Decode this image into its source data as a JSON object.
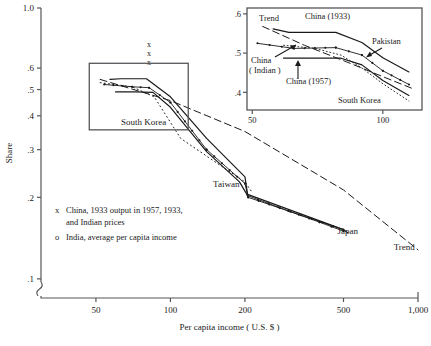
{
  "chart_data": {
    "type": "line",
    "title": "",
    "xlabel": "Per capita income ( U.S. $ )",
    "ylabel": "Share",
    "xscale": "log",
    "yscale": "log",
    "xlim": [
      30,
      1000
    ],
    "ylim": [
      0.085,
      1.0
    ],
    "xticks": [
      "50",
      "100",
      "200",
      "500",
      "1,000"
    ],
    "xtick_values": [
      50,
      100,
      200,
      500,
      1000
    ],
    "yticks": [
      "1.0",
      ".6",
      ".5",
      ".4",
      ".3",
      ".2",
      ".1"
    ],
    "ytick_values": [
      1.0,
      0.6,
      0.5,
      0.4,
      0.3,
      0.2,
      0.1
    ],
    "axis_break": true,
    "grid": false,
    "legend": [
      {
        "marker": "x",
        "text_line1": "China, 1933 output in 1957, 1933,",
        "text_line2": "and Indian prices"
      },
      {
        "marker": "o",
        "text_line1": "India, average per capita income",
        "text_line2": ""
      }
    ],
    "annotations": [
      {
        "name": "south-korea",
        "label": "South Korea",
        "x": 78,
        "y": 0.37
      },
      {
        "name": "taiwan",
        "label": "Taiwan",
        "x": 168,
        "y": 0.218
      },
      {
        "name": "japan",
        "label": "Japan",
        "x": 520,
        "y": 0.147
      },
      {
        "name": "trend",
        "label": "Trend",
        "x": 880,
        "y": 0.128
      }
    ],
    "point_markers_x": [
      {
        "x": 82,
        "y": 0.72
      },
      {
        "x": 82,
        "y": 0.665
      },
      {
        "x": 82,
        "y": 0.618
      }
    ],
    "series": [
      {
        "name": "China (1933)",
        "style": "solid",
        "points": [
          [
            57,
            0.545
          ],
          [
            63,
            0.548
          ],
          [
            80,
            0.548
          ],
          [
            100,
            0.47
          ],
          [
            140,
            0.33
          ],
          [
            200,
            0.238
          ],
          [
            205,
            0.205
          ],
          [
            500,
            0.152
          ],
          [
            520,
            0.148
          ]
        ]
      },
      {
        "name": "China (Indian)",
        "style": "solid-dots",
        "points": [
          [
            54,
            0.522
          ],
          [
            70,
            0.512
          ],
          [
            82,
            0.508
          ],
          [
            100,
            0.448
          ],
          [
            140,
            0.3
          ],
          [
            200,
            0.225
          ],
          [
            206,
            0.2
          ],
          [
            500,
            0.152
          ]
        ]
      },
      {
        "name": "China (1957)",
        "style": "solid",
        "points": [
          [
            60,
            0.49
          ],
          [
            72,
            0.49
          ],
          [
            85,
            0.488
          ],
          [
            100,
            0.43
          ],
          [
            140,
            0.295
          ],
          [
            190,
            0.228
          ],
          [
            205,
            0.203
          ]
        ]
      },
      {
        "name": "South Korea",
        "style": "dotted",
        "points": [
          [
            52,
            0.53
          ],
          [
            70,
            0.512
          ],
          [
            86,
            0.47
          ],
          [
            110,
            0.33
          ],
          [
            150,
            0.272
          ],
          [
            200,
            0.228
          ],
          [
            215,
            0.207
          ]
        ]
      },
      {
        "name": "Trend",
        "style": "dashed",
        "points": [
          [
            52,
            0.545
          ],
          [
            100,
            0.455
          ],
          [
            200,
            0.35
          ],
          [
            500,
            0.213
          ],
          [
            1000,
            0.128
          ]
        ]
      },
      {
        "name": "Japan",
        "style": "solid-dots",
        "points": [
          [
            205,
            0.203
          ],
          [
            300,
            0.178
          ],
          [
            400,
            0.162
          ],
          [
            500,
            0.15
          ]
        ]
      }
    ]
  },
  "inset": {
    "xlabel": "",
    "ylabel": "",
    "xticks": [
      "50",
      "100"
    ],
    "xtick_values": [
      50,
      100
    ],
    "yticks": [
      ".6",
      ".5",
      ".4"
    ],
    "ytick_values": [
      0.6,
      0.5,
      0.4
    ],
    "xlim": [
      48,
      115
    ],
    "ylim": [
      0.355,
      0.615
    ],
    "labels": [
      {
        "name": "trend",
        "text": "Trend"
      },
      {
        "name": "china-1933",
        "text": "China  (1933)"
      },
      {
        "name": "pakistan",
        "text": "Pakistan"
      },
      {
        "name": "china-indian-line1",
        "text": "China"
      },
      {
        "name": "china-indian-line2",
        "text": "( Indian )"
      },
      {
        "name": "china-1957",
        "text": "China  (1957)"
      },
      {
        "name": "south-korea",
        "text": "South Korea"
      }
    ],
    "series": [
      {
        "name": "China (1933)",
        "style": "solid",
        "points": [
          [
            58,
            0.562
          ],
          [
            64,
            0.553
          ],
          [
            82,
            0.553
          ],
          [
            92,
            0.527
          ],
          [
            100,
            0.488
          ],
          [
            110,
            0.452
          ]
        ]
      },
      {
        "name": "China (Indian)",
        "style": "solid-dots",
        "points": [
          [
            52,
            0.525
          ],
          [
            66,
            0.512
          ],
          [
            82,
            0.514
          ],
          [
            92,
            0.495
          ],
          [
            100,
            0.455
          ],
          [
            110,
            0.42
          ]
        ]
      },
      {
        "name": "China (1957)",
        "style": "solid",
        "points": [
          [
            62,
            0.487
          ],
          [
            70,
            0.487
          ],
          [
            84,
            0.487
          ],
          [
            92,
            0.47
          ],
          [
            100,
            0.43
          ],
          [
            110,
            0.392
          ]
        ]
      },
      {
        "name": "South Korea",
        "style": "dotted-line",
        "points": [
          [
            62,
            0.52
          ],
          [
            74,
            0.512
          ],
          [
            84,
            0.495
          ],
          [
            92,
            0.462
          ],
          [
            100,
            0.422
          ],
          [
            110,
            0.378
          ]
        ]
      },
      {
        "name": "Trend",
        "style": "dashed",
        "points": [
          [
            54,
            0.568
          ],
          [
            70,
            0.52
          ],
          [
            86,
            0.478
          ],
          [
            100,
            0.44
          ],
          [
            112,
            0.408
          ]
        ]
      }
    ]
  },
  "colors": {
    "ink": "#1a1a1a",
    "axis": "#55565a",
    "background": "#ffffff"
  }
}
